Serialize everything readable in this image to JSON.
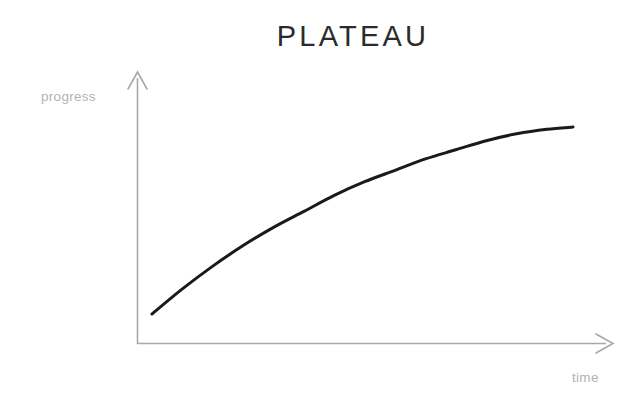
{
  "figure": {
    "title": "PLATEAU",
    "background_color": "#ffffff",
    "title_color": "#2b2b2b",
    "axis_color": "#a8a8a8",
    "curve_color": "#1a1a1a",
    "label_color": "#b3b3b3"
  },
  "axes": {
    "y_label": "progress",
    "x_label": "time"
  },
  "chart_data": {
    "type": "line",
    "title": "PLATEAU",
    "subtitle": "",
    "xlabel": "time",
    "ylabel": "progress",
    "grid": false,
    "legend": null,
    "axis_style": "arrow",
    "tick_labels": {
      "x": [],
      "y": []
    },
    "xlim": [
      0,
      1
    ],
    "ylim": [
      0,
      1
    ],
    "annotations": [],
    "series": [
      {
        "name": "progress over time",
        "shape": "concave-down saturating curve",
        "color": "#1a1a1a",
        "line_width": 3,
        "x": [
          0.03,
          0.1,
          0.17,
          0.24,
          0.31,
          0.38,
          0.45,
          0.52,
          0.59,
          0.66,
          0.73,
          0.8,
          0.87,
          0.94,
          1.0
        ],
        "y": [
          0.14,
          0.25,
          0.35,
          0.44,
          0.52,
          0.59,
          0.66,
          0.72,
          0.77,
          0.82,
          0.86,
          0.9,
          0.93,
          0.95,
          0.96
        ]
      }
    ]
  }
}
